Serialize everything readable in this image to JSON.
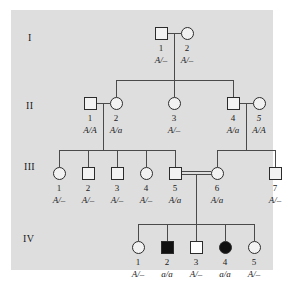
{
  "figure": {
    "kind": "pedigree-chart",
    "panel_color": "#dedede",
    "symbol_stroke": "#2b2b2b",
    "line_color": "#4a4a4a",
    "affected_fill": "#111111",
    "unaffected_fill": "#f2f2f2"
  },
  "generations": [
    {
      "label": "I"
    },
    {
      "label": "II"
    },
    {
      "label": "III"
    },
    {
      "label": "IV"
    }
  ],
  "individuals": {
    "I1": {
      "number": "1",
      "genotype": "A/–",
      "sex": "male",
      "status": "unaffected"
    },
    "I2": {
      "number": "2",
      "genotype": "A/–",
      "sex": "female",
      "status": "unaffected"
    },
    "II1": {
      "number": "1",
      "genotype": "A/A",
      "sex": "male",
      "status": "unaffected"
    },
    "II2": {
      "number": "2",
      "genotype": "A/a",
      "sex": "female",
      "status": "unaffected"
    },
    "II3": {
      "number": "3",
      "genotype": "A/–",
      "sex": "female",
      "status": "unaffected"
    },
    "II4": {
      "number": "4",
      "genotype": "A/a",
      "sex": "male",
      "status": "unaffected"
    },
    "II5": {
      "number": "5",
      "genotype": "A/A",
      "sex": "female",
      "status": "unaffected"
    },
    "III1": {
      "number": "1",
      "genotype": "A/–",
      "sex": "female",
      "status": "unaffected"
    },
    "III2": {
      "number": "2",
      "genotype": "A/–",
      "sex": "male",
      "status": "unaffected"
    },
    "III3": {
      "number": "3",
      "genotype": "A/–",
      "sex": "male",
      "status": "unaffected"
    },
    "III4": {
      "number": "4",
      "genotype": "A/–",
      "sex": "female",
      "status": "unaffected"
    },
    "III5": {
      "number": "5",
      "genotype": "A/a",
      "sex": "male",
      "status": "unaffected"
    },
    "III6": {
      "number": "6",
      "genotype": "A/a",
      "sex": "female",
      "status": "unaffected"
    },
    "III7": {
      "number": "7",
      "genotype": "A/–",
      "sex": "male",
      "status": "unaffected"
    },
    "IV1": {
      "number": "1",
      "genotype": "A/–",
      "sex": "female",
      "status": "unaffected"
    },
    "IV2": {
      "number": "2",
      "genotype": "a/a",
      "sex": "male",
      "status": "affected"
    },
    "IV3": {
      "number": "3",
      "genotype": "A/–",
      "sex": "male",
      "status": "unaffected"
    },
    "IV4": {
      "number": "4",
      "genotype": "a/a",
      "sex": "female",
      "status": "affected"
    },
    "IV5": {
      "number": "5",
      "genotype": "A/–",
      "sex": "female",
      "status": "unaffected"
    }
  }
}
